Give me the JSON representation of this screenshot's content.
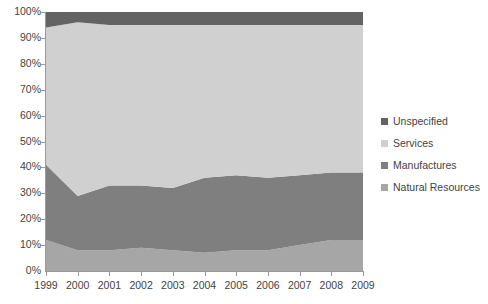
{
  "chart_data": {
    "type": "area",
    "title": "",
    "subtitle": "",
    "xlabel": "",
    "ylabel": "",
    "stacked": true,
    "normalized_percent": true,
    "grid": false,
    "legend_position": "right",
    "categories": [
      "1999",
      "2000",
      "2001",
      "2002",
      "2003",
      "2004",
      "2005",
      "2006",
      "2007",
      "2008",
      "2009"
    ],
    "x": [
      1999,
      2000,
      2001,
      2002,
      2003,
      2004,
      2005,
      2006,
      2007,
      2008,
      2009
    ],
    "ylim": [
      0,
      100
    ],
    "ytick_values": [
      0,
      10,
      20,
      30,
      40,
      50,
      60,
      70,
      80,
      90,
      100
    ],
    "ytick_labels": [
      "0%",
      "10%",
      "20%",
      "30%",
      "40%",
      "50%",
      "60%",
      "70%",
      "80%",
      "90%",
      "100%"
    ],
    "stack_order_bottom_to_top": [
      "Natural Resources",
      "Manufactures",
      "Services",
      "Unspecified"
    ],
    "series": [
      {
        "name": "Natural Resources",
        "color": "#a6a6a6",
        "values": [
          12,
          8,
          8,
          9,
          8,
          7,
          8,
          8,
          10,
          12,
          12
        ]
      },
      {
        "name": "Manufactures",
        "color": "#7f7f7f",
        "values": [
          29,
          21,
          25,
          24,
          24,
          29,
          29,
          28,
          27,
          26,
          26
        ]
      },
      {
        "name": "Services",
        "color": "#d0d0d0",
        "values": [
          53,
          67,
          62,
          62,
          63,
          59,
          58,
          59,
          58,
          57,
          57
        ]
      },
      {
        "name": "Unspecified",
        "color": "#636363",
        "values": [
          6,
          4,
          5,
          5,
          5,
          5,
          5,
          5,
          5,
          5,
          5
        ]
      }
    ],
    "cumulative_upper_bounds": {
      "Natural Resources": [
        12,
        8,
        8,
        9,
        8,
        7,
        8,
        8,
        10,
        12,
        12
      ],
      "Manufactures": [
        41,
        29,
        33,
        33,
        32,
        36,
        37,
        36,
        37,
        38,
        38
      ],
      "Services": [
        94,
        96,
        95,
        95,
        95,
        95,
        95,
        95,
        95,
        95,
        95
      ],
      "Unspecified": [
        100,
        100,
        100,
        100,
        100,
        100,
        100,
        100,
        100,
        100,
        100
      ]
    }
  },
  "legend": {
    "items": [
      {
        "label": "Unspecified",
        "color": "#636363"
      },
      {
        "label": "Services",
        "color": "#d0d0d0"
      },
      {
        "label": "Manufactures",
        "color": "#7f7f7f"
      },
      {
        "label": "Natural Resources",
        "color": "#a6a6a6"
      }
    ]
  },
  "axes": {
    "y_labels": [
      "100%",
      "90%",
      "80%",
      "70%",
      "60%",
      "50%",
      "40%",
      "30%",
      "20%",
      "10%",
      "0%"
    ],
    "x_labels": [
      "1999",
      "2000",
      "2001",
      "2002",
      "2003",
      "2004",
      "2005",
      "2006",
      "2007",
      "2008",
      "2009"
    ]
  },
  "colors": {
    "axis": "#9a9a9a",
    "text": "#3f3f3f",
    "background": "#ffffff"
  }
}
